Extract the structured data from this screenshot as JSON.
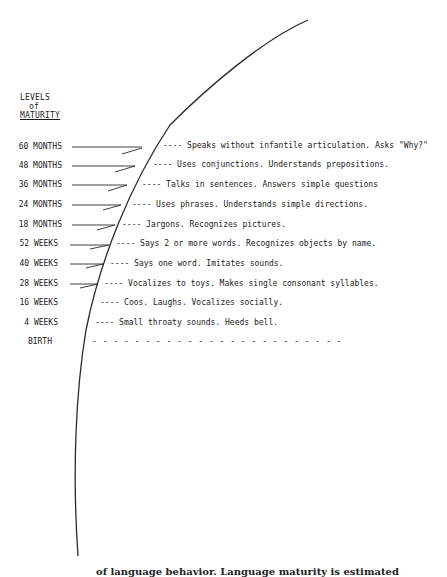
{
  "header": {
    "line1": "LEVELS",
    "line2": "of",
    "line3": "MATURITY"
  },
  "levels": [
    {
      "label": "60 MONTHS",
      "desc": "---- Speaks without infantile articulation.  Asks \"Why?\""
    },
    {
      "label": "48 MONTHS",
      "desc": "---- Uses conjunctions.  Understands prepositions."
    },
    {
      "label": "36 MONTHS",
      "desc": "---- Talks in sentences.  Answers simple questions"
    },
    {
      "label": "24 MONTHS",
      "desc": "---- Uses phrases.  Understands simple directions."
    },
    {
      "label": "18 MONTHS",
      "desc": "---- Jargons.  Recognizes pictures."
    },
    {
      "label": "52 WEEKS",
      "desc": "---- Says 2 or more words.  Recognizes objects by name."
    },
    {
      "label": "40 WEEKS",
      "desc": "---- Says one word.  Imitates sounds."
    },
    {
      "label": "28 WEEKS",
      "desc": "---- Vocalizes to toys.  Makes single consonant syllables."
    },
    {
      "label": "16 WEEKS",
      "desc": "---- Coos.  Laughs.  Vocalizes socially."
    },
    {
      "label": "4 WEEKS",
      "desc": "---- Small throaty sounds.  Heeds bell."
    },
    {
      "label": "BIRTH",
      "desc": "- - - - - - - - - - - - - - - - - - - - - - - -"
    }
  ],
  "caption": "of language behavior. Language maturity is estimated"
}
